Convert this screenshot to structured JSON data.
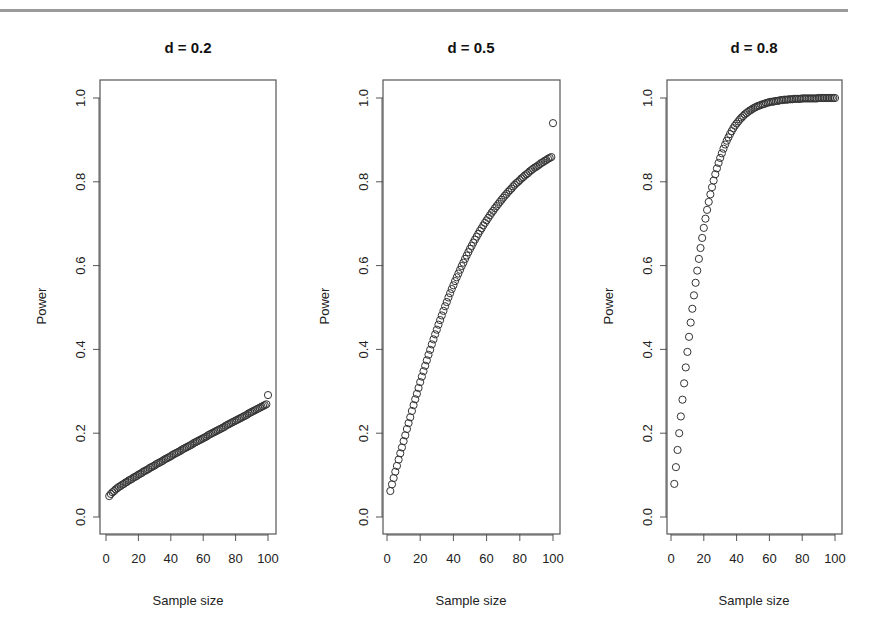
{
  "chart_data": [
    {
      "type": "scatter",
      "title": "d = 0.2",
      "xlabel": "Sample size",
      "ylabel": "Power",
      "xlim": [
        0,
        100
      ],
      "ylim": [
        0,
        1
      ],
      "xticks": [
        "0",
        "20",
        "40",
        "60",
        "80",
        "100"
      ],
      "yticks": [
        "0.0",
        "0.2",
        "0.4",
        "0.6",
        "0.8",
        "1.0"
      ],
      "marker": "open-circle",
      "x_start": 2,
      "x_end": 100,
      "values": [
        0.05,
        0.055,
        0.059,
        0.062,
        0.066,
        0.069,
        0.072,
        0.074,
        0.077,
        0.079,
        0.082,
        0.084,
        0.087,
        0.089,
        0.091,
        0.094,
        0.096,
        0.098,
        0.101,
        0.103,
        0.105,
        0.108,
        0.11,
        0.112,
        0.114,
        0.117,
        0.119,
        0.121,
        0.123,
        0.126,
        0.128,
        0.13,
        0.132,
        0.134,
        0.137,
        0.139,
        0.141,
        0.143,
        0.145,
        0.148,
        0.15,
        0.152,
        0.154,
        0.156,
        0.158,
        0.161,
        0.163,
        0.165,
        0.167,
        0.169,
        0.171,
        0.173,
        0.176,
        0.178,
        0.18,
        0.182,
        0.184,
        0.186,
        0.188,
        0.19,
        0.192,
        0.195,
        0.197,
        0.199,
        0.201,
        0.203,
        0.205,
        0.207,
        0.209,
        0.211,
        0.213,
        0.215,
        0.218,
        0.22,
        0.222,
        0.224,
        0.226,
        0.228,
        0.23,
        0.232,
        0.234,
        0.236,
        0.238,
        0.24,
        0.242,
        0.244,
        0.247,
        0.249,
        0.251,
        0.253,
        0.255,
        0.257,
        0.259,
        0.261,
        0.263,
        0.265,
        0.267,
        0.269,
        0.291
      ]
    },
    {
      "type": "scatter",
      "title": "d = 0.5",
      "xlabel": "Sample size",
      "ylabel": "Power",
      "xlim": [
        0,
        100
      ],
      "ylim": [
        0,
        1
      ],
      "xticks": [
        "0",
        "20",
        "40",
        "60",
        "80",
        "100"
      ],
      "yticks": [
        "0.0",
        "0.2",
        "0.4",
        "0.6",
        "0.8",
        "1.0"
      ],
      "marker": "open-circle",
      "x_start": 2,
      "x_end": 100,
      "values": [
        0.062,
        0.078,
        0.093,
        0.108,
        0.122,
        0.137,
        0.152,
        0.166,
        0.181,
        0.195,
        0.21,
        0.224,
        0.238,
        0.253,
        0.267,
        0.281,
        0.294,
        0.308,
        0.322,
        0.335,
        0.348,
        0.361,
        0.374,
        0.387,
        0.399,
        0.412,
        0.424,
        0.436,
        0.447,
        0.459,
        0.47,
        0.481,
        0.492,
        0.503,
        0.513,
        0.524,
        0.534,
        0.544,
        0.553,
        0.563,
        0.572,
        0.581,
        0.59,
        0.599,
        0.607,
        0.616,
        0.624,
        0.632,
        0.64,
        0.647,
        0.655,
        0.662,
        0.669,
        0.676,
        0.683,
        0.689,
        0.696,
        0.702,
        0.708,
        0.714,
        0.72,
        0.726,
        0.731,
        0.737,
        0.742,
        0.747,
        0.752,
        0.757,
        0.762,
        0.767,
        0.771,
        0.776,
        0.78,
        0.784,
        0.789,
        0.793,
        0.797,
        0.8,
        0.804,
        0.808,
        0.811,
        0.815,
        0.818,
        0.821,
        0.825,
        0.828,
        0.831,
        0.834,
        0.836,
        0.839,
        0.842,
        0.845,
        0.847,
        0.85,
        0.852,
        0.855,
        0.857,
        0.859,
        0.94
      ]
    },
    {
      "type": "scatter",
      "title": "d = 0.8",
      "xlabel": "Sample size",
      "ylabel": "Power",
      "xlim": [
        0,
        100
      ],
      "ylim": [
        0,
        1
      ],
      "xticks": [
        "0",
        "20",
        "40",
        "60",
        "80",
        "100"
      ],
      "yticks": [
        "0.0",
        "0.2",
        "0.4",
        "0.6",
        "0.8",
        "1.0"
      ],
      "marker": "open-circle",
      "x_start": 2,
      "x_end": 100,
      "values": [
        0.079,
        0.119,
        0.16,
        0.2,
        0.24,
        0.28,
        0.319,
        0.357,
        0.394,
        0.43,
        0.464,
        0.497,
        0.529,
        0.559,
        0.588,
        0.616,
        0.642,
        0.666,
        0.69,
        0.712,
        0.733,
        0.752,
        0.77,
        0.787,
        0.803,
        0.818,
        0.832,
        0.845,
        0.857,
        0.868,
        0.879,
        0.889,
        0.898,
        0.906,
        0.914,
        0.921,
        0.928,
        0.934,
        0.939,
        0.944,
        0.949,
        0.953,
        0.957,
        0.961,
        0.964,
        0.967,
        0.97,
        0.972,
        0.975,
        0.977,
        0.979,
        0.981,
        0.982,
        0.984,
        0.985,
        0.986,
        0.988,
        0.989,
        0.99,
        0.991,
        0.991,
        0.992,
        0.993,
        0.993,
        0.994,
        0.995,
        0.995,
        0.996,
        0.996,
        0.996,
        0.997,
        0.997,
        0.997,
        0.998,
        0.998,
        0.998,
        0.998,
        0.998,
        0.999,
        0.999,
        0.999,
        0.999,
        0.999,
        0.999,
        0.999,
        0.999,
        0.999,
        0.999,
        1.0,
        1.0,
        1.0,
        1.0,
        1.0,
        1.0,
        1.0,
        1.0,
        1.0,
        1.0,
        1.0
      ]
    }
  ],
  "panels": [
    {
      "title": "d = 0.2",
      "xlabel": "Sample size",
      "ylabel": "Power"
    },
    {
      "title": "d = 0.5",
      "xlabel": "Sample size",
      "ylabel": "Power"
    },
    {
      "title": "d = 0.8",
      "xlabel": "Sample size",
      "ylabel": "Power"
    }
  ],
  "colors": {
    "points": "#333333",
    "axis": "#555555",
    "rule": "#9a9a9a"
  }
}
